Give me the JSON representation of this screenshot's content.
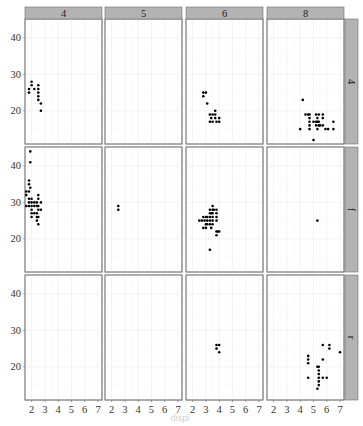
{
  "chart_data": {
    "type": "scatter",
    "title": "",
    "xlabel": "",
    "ylabel": "",
    "facet": {
      "cols_var": "cyl",
      "rows_var": "drv",
      "col_labels": [
        "4",
        "5",
        "6",
        "8"
      ],
      "row_labels": [
        "4",
        "f",
        "r"
      ]
    },
    "x_ticks": [
      "2",
      "3",
      "4",
      "5",
      "6",
      "7"
    ],
    "y_ticks": [
      "20",
      "30",
      "40"
    ],
    "xlim": [
      1.5,
      7.3
    ],
    "ylim": [
      10.9,
      45.2
    ],
    "grid": true,
    "panels": [
      {
        "row": "4",
        "col": "4",
        "points": [
          [
            1.8,
            26
          ],
          [
            1.8,
            25
          ],
          [
            2.0,
            28
          ],
          [
            2.0,
            27
          ],
          [
            2.2,
            26
          ],
          [
            2.5,
            27
          ],
          [
            2.5,
            26
          ],
          [
            2.5,
            25
          ],
          [
            2.5,
            24
          ],
          [
            2.5,
            23
          ],
          [
            2.7,
            22
          ],
          [
            2.7,
            20
          ]
        ]
      },
      {
        "row": "4",
        "col": "5",
        "points": []
      },
      {
        "row": "4",
        "col": "6",
        "points": [
          [
            2.8,
            25
          ],
          [
            3.0,
            25
          ],
          [
            2.8,
            24
          ],
          [
            3.1,
            22
          ],
          [
            3.3,
            19
          ],
          [
            3.5,
            19
          ],
          [
            3.7,
            20
          ],
          [
            3.7,
            19
          ],
          [
            3.4,
            18
          ],
          [
            3.7,
            18
          ],
          [
            3.3,
            17
          ],
          [
            3.5,
            17
          ],
          [
            3.8,
            17
          ],
          [
            4.0,
            17
          ],
          [
            4.0,
            18
          ]
        ]
      },
      {
        "row": "4",
        "col": "8",
        "points": [
          [
            4.2,
            23
          ],
          [
            4.0,
            15
          ],
          [
            4.4,
            19
          ],
          [
            4.6,
            19
          ],
          [
            4.7,
            19
          ],
          [
            4.7,
            18
          ],
          [
            4.7,
            17
          ],
          [
            4.7,
            16
          ],
          [
            5.0,
            17
          ],
          [
            5.2,
            19
          ],
          [
            5.2,
            17
          ],
          [
            5.2,
            16
          ],
          [
            5.3,
            18
          ],
          [
            5.3,
            15
          ],
          [
            5.4,
            17
          ],
          [
            5.4,
            19
          ],
          [
            5.4,
            16
          ],
          [
            5.5,
            16
          ],
          [
            5.7,
            19
          ],
          [
            5.7,
            18
          ],
          [
            5.9,
            15
          ],
          [
            6.1,
            15
          ],
          [
            6.5,
            15
          ],
          [
            5.7,
            16
          ],
          [
            5.0,
            12
          ],
          [
            6.5,
            17
          ],
          [
            4.7,
            15
          ],
          [
            5.3,
            17
          ]
        ]
      },
      {
        "row": "f",
        "col": "4",
        "points": [
          [
            1.9,
            44
          ],
          [
            1.9,
            41
          ],
          [
            1.8,
            36
          ],
          [
            1.8,
            35
          ],
          [
            1.8,
            33
          ],
          [
            1.9,
            34
          ],
          [
            1.6,
            33
          ],
          [
            1.6,
            32
          ],
          [
            1.8,
            30
          ],
          [
            1.6,
            29
          ],
          [
            1.8,
            29
          ],
          [
            2.0,
            29
          ],
          [
            2.0,
            28
          ],
          [
            2.0,
            30
          ],
          [
            2.0,
            31
          ],
          [
            2.2,
            29
          ],
          [
            2.2,
            30
          ],
          [
            2.4,
            29
          ],
          [
            2.4,
            30
          ],
          [
            2.4,
            27
          ],
          [
            2.4,
            26
          ],
          [
            2.5,
            28
          ],
          [
            2.5,
            29
          ],
          [
            2.5,
            31
          ],
          [
            2.5,
            32
          ],
          [
            2.0,
            26
          ],
          [
            2.0,
            27
          ],
          [
            2.2,
            27
          ],
          [
            2.4,
            25
          ],
          [
            2.5,
            24
          ],
          [
            2.5,
            26
          ],
          [
            2.7,
            28
          ],
          [
            2.7,
            30
          ],
          [
            1.8,
            31
          ]
        ]
      },
      {
        "row": "f",
        "col": "5",
        "points": [
          [
            2.5,
            29
          ],
          [
            2.5,
            28
          ]
        ]
      },
      {
        "row": "f",
        "col": "6",
        "points": [
          [
            3.5,
            29
          ],
          [
            3.5,
            28
          ],
          [
            3.6,
            28
          ],
          [
            3.8,
            28
          ],
          [
            3.8,
            27
          ],
          [
            3.3,
            28
          ],
          [
            3.3,
            27
          ],
          [
            3.4,
            27
          ],
          [
            3.5,
            27
          ],
          [
            3.5,
            26
          ],
          [
            3.3,
            26
          ],
          [
            3.1,
            26
          ],
          [
            3.0,
            26
          ],
          [
            2.8,
            26
          ],
          [
            2.5,
            25
          ],
          [
            2.7,
            25
          ],
          [
            2.9,
            25
          ],
          [
            3.1,
            25
          ],
          [
            3.3,
            25
          ],
          [
            3.5,
            25
          ],
          [
            3.8,
            26
          ],
          [
            3.0,
            24
          ],
          [
            3.1,
            24
          ],
          [
            3.3,
            24
          ],
          [
            3.5,
            24
          ],
          [
            2.8,
            23
          ],
          [
            3.0,
            23
          ],
          [
            3.4,
            23
          ],
          [
            3.8,
            22
          ],
          [
            3.9,
            22
          ],
          [
            3.8,
            21
          ],
          [
            3.3,
            17
          ],
          [
            4.0,
            22
          ],
          [
            3.8,
            25
          ]
        ]
      },
      {
        "row": "f",
        "col": "8",
        "points": [
          [
            5.3,
            25
          ]
        ]
      },
      {
        "row": "r",
        "col": "4",
        "points": []
      },
      {
        "row": "r",
        "col": "5",
        "points": []
      },
      {
        "row": "r",
        "col": "6",
        "points": [
          [
            3.8,
            26
          ],
          [
            4.0,
            26
          ],
          [
            3.8,
            25
          ],
          [
            4.0,
            24
          ]
        ]
      },
      {
        "row": "r",
        "col": "8",
        "points": [
          [
            4.6,
            22
          ],
          [
            4.6,
            21
          ],
          [
            4.6,
            23
          ],
          [
            4.6,
            17
          ],
          [
            5.4,
            20
          ],
          [
            5.3,
            20
          ],
          [
            5.4,
            17
          ],
          [
            5.4,
            16
          ],
          [
            5.4,
            15
          ],
          [
            5.4,
            18
          ],
          [
            5.3,
            14
          ],
          [
            5.7,
            26
          ],
          [
            5.7,
            22
          ],
          [
            5.7,
            17
          ],
          [
            6.0,
            17
          ],
          [
            6.2,
            26
          ],
          [
            6.2,
            25
          ],
          [
            7.0,
            24
          ],
          [
            5.4,
            19
          ]
        ]
      }
    ]
  },
  "caption": "displ"
}
